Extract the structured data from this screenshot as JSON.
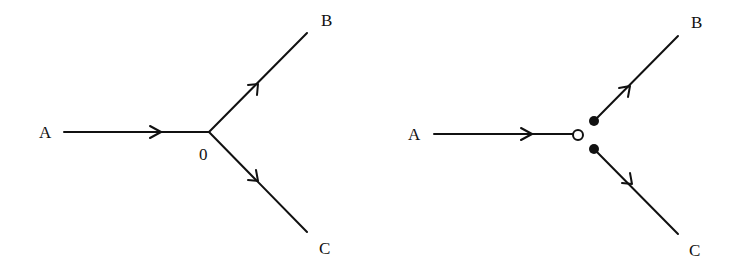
{
  "colors": {
    "ink": "#111111",
    "background": "#ffffff"
  },
  "diagrams": [
    {
      "id": "left",
      "description": "Junction without separated ends",
      "nodes": {
        "A": {
          "label": "A"
        },
        "O": {
          "label": "0"
        },
        "B": {
          "label": "B"
        },
        "C": {
          "label": "C"
        }
      },
      "edges": [
        {
          "from": "A",
          "to": "O",
          "directed": true
        },
        {
          "from": "O",
          "to": "B",
          "directed": true
        },
        {
          "from": "O",
          "to": "C",
          "directed": true
        }
      ]
    },
    {
      "id": "right",
      "description": "Junction split into endpoints: open circle at end of A, filled dots at starts of B and C",
      "nodes": {
        "A": {
          "label": "A"
        },
        "B": {
          "label": "B"
        },
        "C": {
          "label": "C"
        }
      },
      "endpoints": [
        {
          "type": "open-circle",
          "on_edge": "A"
        },
        {
          "type": "filled-dot",
          "on_edge": "B"
        },
        {
          "type": "filled-dot",
          "on_edge": "C"
        }
      ],
      "edges": [
        {
          "from": "A",
          "to": "open-circle",
          "directed": true
        },
        {
          "from": "filled-dot-upper",
          "to": "B",
          "directed": true
        },
        {
          "from": "filled-dot-lower",
          "to": "C",
          "directed": true
        }
      ]
    }
  ]
}
